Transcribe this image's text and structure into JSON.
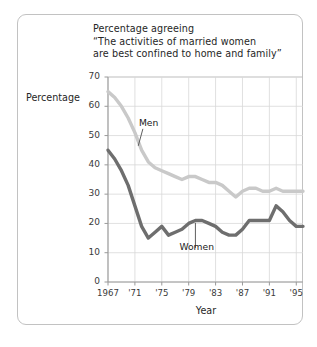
{
  "figure": {
    "title_lines": [
      "Percentage agreeing",
      "“The activities of married women",
      "are best confined to home and family”"
    ],
    "y_axis_label": "Percentage",
    "x_axis_label": "Year",
    "men_label": "Men",
    "women_label": "Women"
  },
  "chart_data": {
    "type": "line",
    "title": "Percentage agreeing “The activities of married women are best confined to home and family”",
    "xlabel": "Year",
    "ylabel": "Percentage",
    "xlim": [
      1967,
      1996
    ],
    "ylim": [
      0,
      70
    ],
    "ytick_labels": [
      "0",
      "10",
      "20",
      "30",
      "40",
      "50",
      "60",
      "70"
    ],
    "yticks": [
      0,
      10,
      20,
      30,
      40,
      50,
      60,
      70
    ],
    "xtick_labels": [
      "1967",
      "'71",
      "'75",
      "'79",
      "'83",
      "'87",
      "'91",
      "'95"
    ],
    "xticks": [
      1967,
      1971,
      1975,
      1979,
      1983,
      1987,
      1991,
      1995
    ],
    "grid": true,
    "legend": "inline-annotations",
    "annotations": [
      {
        "text": "Men",
        "x": 1971,
        "y": 54
      },
      {
        "text": "Women",
        "x": 1980,
        "y": 12
      }
    ],
    "colors": {
      "men": "#c9c9c9",
      "women": "#6e6e6e",
      "grid": "#d8d8d8",
      "axis": "#9a9a9a"
    },
    "x": [
      1967,
      1968,
      1969,
      1970,
      1971,
      1972,
      1973,
      1974,
      1975,
      1976,
      1977,
      1978,
      1979,
      1980,
      1981,
      1982,
      1983,
      1984,
      1985,
      1986,
      1987,
      1988,
      1989,
      1990,
      1991,
      1992,
      1993,
      1994,
      1995,
      1996
    ],
    "series": [
      {
        "name": "Men",
        "color": "#c9c9c9",
        "values": [
          65,
          63,
          60,
          56,
          51,
          45,
          41,
          39,
          38,
          37,
          36,
          35,
          36,
          36,
          35,
          34,
          34,
          33,
          31,
          29,
          31,
          32,
          32,
          31,
          31,
          32,
          31,
          31,
          31,
          31
        ]
      },
      {
        "name": "Women",
        "color": "#6e6e6e",
        "values": [
          45,
          42,
          38,
          33,
          26,
          19,
          15,
          17,
          19,
          16,
          17,
          18,
          20,
          21,
          21,
          20,
          19,
          17,
          16,
          16,
          18,
          21,
          21,
          21,
          21,
          26,
          24,
          21,
          19,
          19
        ]
      }
    ]
  }
}
